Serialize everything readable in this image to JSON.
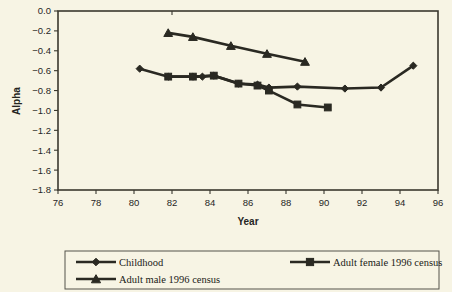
{
  "chart_data": {
    "type": "line",
    "title": "",
    "xlabel": "Year",
    "ylabel": "Alpha",
    "xlim": [
      76,
      96
    ],
    "ylim": [
      -1.8,
      0.0
    ],
    "xticks": [
      "76",
      "78",
      "80",
      "82",
      "84",
      "86",
      "88",
      "90",
      "92",
      "94",
      "96"
    ],
    "yticks": [
      "0.0",
      "-0.2",
      "-0.4",
      "-0.6",
      "-0.8",
      "-1.0",
      "-1.2",
      "-1.4",
      "-1.6",
      "-1.8"
    ],
    "grid": false,
    "legend_position": "bottom",
    "series": [
      {
        "name": "Childhood",
        "marker": "diamond",
        "x": [
          80.3,
          81.8,
          83.1,
          83.6,
          84.2,
          85.5,
          86.5,
          87.1,
          88.6,
          91.1,
          93.0,
          94.7
        ],
        "y": [
          -0.58,
          -0.66,
          -0.66,
          -0.66,
          -0.65,
          -0.73,
          -0.74,
          -0.77,
          -0.76,
          -0.78,
          -0.77,
          -0.55
        ]
      },
      {
        "name": "Adult female 1996 census",
        "marker": "square",
        "x": [
          81.8,
          83.1,
          84.2,
          85.5,
          86.5,
          87.1,
          88.6,
          90.2
        ],
        "y": [
          -0.66,
          -0.66,
          -0.65,
          -0.73,
          -0.75,
          -0.8,
          -0.94,
          -0.97
        ]
      },
      {
        "name": "Adult male 1996 census",
        "marker": "triangle",
        "x": [
          81.8,
          83.1,
          85.1,
          87.0,
          89.0
        ],
        "y": [
          -0.22,
          -0.26,
          -0.35,
          -0.43,
          -0.51
        ]
      }
    ]
  },
  "axes": {
    "x_title": "Year",
    "y_title": "Alpha",
    "x_tick_labels": [
      "76",
      "78",
      "80",
      "82",
      "84",
      "86",
      "88",
      "90",
      "92",
      "94",
      "96"
    ],
    "y_tick_labels": [
      "0.0",
      "-0.2",
      "-0.4",
      "-0.6",
      "-0.8",
      "-1.0",
      "-1.2",
      "-1.4",
      "-1.6",
      "-1.8"
    ]
  },
  "legend": {
    "entries": [
      {
        "label": "Childhood",
        "marker": "diamond"
      },
      {
        "label": "Adult female 1996 census",
        "marker": "square"
      },
      {
        "label": "Adult male 1996 census",
        "marker": "triangle"
      }
    ]
  },
  "colors": {
    "background": "#f7f4e4",
    "ink": "#2a2922",
    "frame": "#3a382e"
  }
}
